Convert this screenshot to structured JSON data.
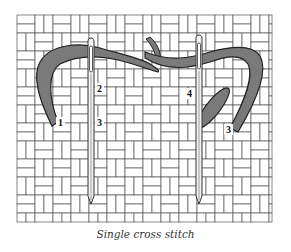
{
  "figure": {
    "caption": "Single cross stitch",
    "labels": [
      {
        "id": "step-1",
        "text": "1",
        "x": 58,
        "y": 126
      },
      {
        "id": "step-2",
        "text": "2",
        "x": 97,
        "y": 92
      },
      {
        "id": "step-3-left",
        "text": "3",
        "x": 97,
        "y": 126
      },
      {
        "id": "step-4",
        "text": "4",
        "x": 187,
        "y": 97
      },
      {
        "id": "step-3-right",
        "text": "3",
        "x": 226,
        "y": 133
      }
    ],
    "colors": {
      "background": "#ffffff",
      "grid_line": "#555555",
      "thread_fill": "#7a7a7a",
      "thread_outline": "#222222",
      "needle_fill": "#f2f2f2",
      "needle_outline": "#333333",
      "caption_text": "#333333"
    },
    "grid": {
      "left": 17,
      "top": 15,
      "right": 272,
      "bottom": 222,
      "block": 18
    }
  }
}
